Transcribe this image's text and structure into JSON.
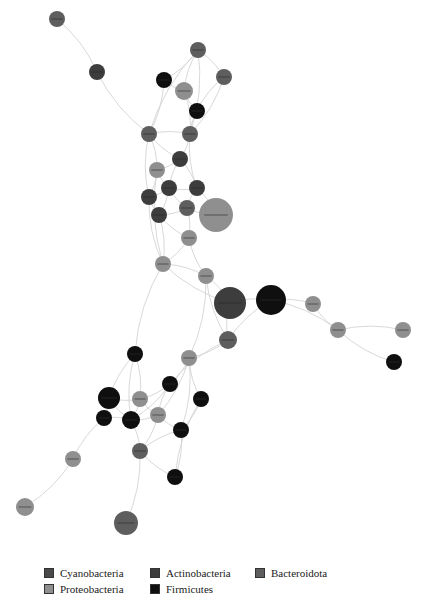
{
  "diagram": {
    "type": "co-occurrence network",
    "phylum_colors": {
      "Cyanobacteria": "#4a4a4a",
      "Actinobacteria": "#3d3d3d",
      "Bacteroidota": "#5e5e5e",
      "Proteobacteria": "#8f8f8f",
      "Firmicutes": "#0f0f0f"
    },
    "nodes": [
      {
        "id": "n1",
        "x": 57,
        "y": 19,
        "r": 8,
        "phylum": "Bacteroidota"
      },
      {
        "id": "n2",
        "x": 97,
        "y": 72,
        "r": 8,
        "phylum": "Actinobacteria"
      },
      {
        "id": "n3",
        "x": 198,
        "y": 50,
        "r": 8,
        "phylum": "Bacteroidota"
      },
      {
        "id": "n4",
        "x": 164,
        "y": 80,
        "r": 8,
        "phylum": "Firmicutes"
      },
      {
        "id": "n5",
        "x": 184,
        "y": 91,
        "r": 9,
        "phylum": "Proteobacteria"
      },
      {
        "id": "n6",
        "x": 224,
        "y": 77,
        "r": 8,
        "phylum": "Bacteroidota"
      },
      {
        "id": "n7",
        "x": 197,
        "y": 111,
        "r": 8,
        "phylum": "Firmicutes"
      },
      {
        "id": "n8",
        "x": 149,
        "y": 134,
        "r": 8,
        "phylum": "Bacteroidota"
      },
      {
        "id": "n9",
        "x": 190,
        "y": 134,
        "r": 8,
        "phylum": "Bacteroidota"
      },
      {
        "id": "n10",
        "x": 180,
        "y": 159,
        "r": 8,
        "phylum": "Actinobacteria"
      },
      {
        "id": "n11",
        "x": 157,
        "y": 170,
        "r": 8,
        "phylum": "Proteobacteria"
      },
      {
        "id": "n12",
        "x": 169,
        "y": 188,
        "r": 8,
        "phylum": "Actinobacteria"
      },
      {
        "id": "n13",
        "x": 197,
        "y": 188,
        "r": 8,
        "phylum": "Actinobacteria"
      },
      {
        "id": "n14",
        "x": 149,
        "y": 197,
        "r": 8,
        "phylum": "Actinobacteria"
      },
      {
        "id": "n15",
        "x": 187,
        "y": 208,
        "r": 8,
        "phylum": "Bacteroidota"
      },
      {
        "id": "n16",
        "x": 159,
        "y": 215,
        "r": 8,
        "phylum": "Actinobacteria"
      },
      {
        "id": "n17",
        "x": 216,
        "y": 215,
        "r": 17,
        "phylum": "Proteobacteria"
      },
      {
        "id": "n18",
        "x": 189,
        "y": 238,
        "r": 8,
        "phylum": "Proteobacteria"
      },
      {
        "id": "n19",
        "x": 163,
        "y": 264,
        "r": 8,
        "phylum": "Proteobacteria"
      },
      {
        "id": "n20",
        "x": 206,
        "y": 276,
        "r": 8,
        "phylum": "Proteobacteria"
      },
      {
        "id": "n21",
        "x": 230,
        "y": 303,
        "r": 16,
        "phylum": "Actinobacteria"
      },
      {
        "id": "n22",
        "x": 271,
        "y": 300,
        "r": 15,
        "phylum": "Firmicutes"
      },
      {
        "id": "n23",
        "x": 313,
        "y": 304,
        "r": 8,
        "phylum": "Proteobacteria"
      },
      {
        "id": "n24",
        "x": 338,
        "y": 330,
        "r": 8,
        "phylum": "Proteobacteria"
      },
      {
        "id": "n25",
        "x": 403,
        "y": 330,
        "r": 8,
        "phylum": "Proteobacteria"
      },
      {
        "id": "n26",
        "x": 394,
        "y": 362,
        "r": 8,
        "phylum": "Firmicutes"
      },
      {
        "id": "n27",
        "x": 228,
        "y": 340,
        "r": 9,
        "phylum": "Bacteroidota"
      },
      {
        "id": "n28",
        "x": 189,
        "y": 358,
        "r": 8,
        "phylum": "Proteobacteria"
      },
      {
        "id": "n29",
        "x": 135,
        "y": 354,
        "r": 8,
        "phylum": "Firmicutes"
      },
      {
        "id": "n30",
        "x": 170,
        "y": 384,
        "r": 8,
        "phylum": "Firmicutes"
      },
      {
        "id": "n31",
        "x": 109,
        "y": 398,
        "r": 11,
        "phylum": "Firmicutes"
      },
      {
        "id": "n32",
        "x": 140,
        "y": 399,
        "r": 8,
        "phylum": "Proteobacteria"
      },
      {
        "id": "n33",
        "x": 201,
        "y": 399,
        "r": 8,
        "phylum": "Firmicutes"
      },
      {
        "id": "n34",
        "x": 104,
        "y": 418,
        "r": 8,
        "phylum": "Firmicutes"
      },
      {
        "id": "n35",
        "x": 131,
        "y": 420,
        "r": 9,
        "phylum": "Firmicutes"
      },
      {
        "id": "n36",
        "x": 158,
        "y": 415,
        "r": 8,
        "phylum": "Proteobacteria"
      },
      {
        "id": "n37",
        "x": 181,
        "y": 430,
        "r": 8,
        "phylum": "Firmicutes"
      },
      {
        "id": "n38",
        "x": 140,
        "y": 451,
        "r": 8,
        "phylum": "Bacteroidota"
      },
      {
        "id": "n39",
        "x": 73,
        "y": 459,
        "r": 8,
        "phylum": "Proteobacteria"
      },
      {
        "id": "n40",
        "x": 175,
        "y": 477,
        "r": 8,
        "phylum": "Firmicutes"
      },
      {
        "id": "n41",
        "x": 25,
        "y": 507,
        "r": 9,
        "phylum": "Proteobacteria"
      },
      {
        "id": "n42",
        "x": 126,
        "y": 523,
        "r": 12,
        "phylum": "Bacteroidota"
      }
    ],
    "edges": [
      [
        "n1",
        "n2"
      ],
      [
        "n2",
        "n8"
      ],
      [
        "n3",
        "n4"
      ],
      [
        "n3",
        "n5"
      ],
      [
        "n3",
        "n6"
      ],
      [
        "n3",
        "n8"
      ],
      [
        "n3",
        "n9"
      ],
      [
        "n4",
        "n5"
      ],
      [
        "n4",
        "n8"
      ],
      [
        "n5",
        "n7"
      ],
      [
        "n5",
        "n9"
      ],
      [
        "n6",
        "n7"
      ],
      [
        "n6",
        "n9"
      ],
      [
        "n7",
        "n9"
      ],
      [
        "n8",
        "n9"
      ],
      [
        "n8",
        "n10"
      ],
      [
        "n8",
        "n11"
      ],
      [
        "n8",
        "n14"
      ],
      [
        "n9",
        "n10"
      ],
      [
        "n9",
        "n13"
      ],
      [
        "n10",
        "n11"
      ],
      [
        "n10",
        "n12"
      ],
      [
        "n10",
        "n13"
      ],
      [
        "n11",
        "n12"
      ],
      [
        "n11",
        "n14"
      ],
      [
        "n12",
        "n13"
      ],
      [
        "n12",
        "n14"
      ],
      [
        "n12",
        "n15"
      ],
      [
        "n12",
        "n16"
      ],
      [
        "n13",
        "n15"
      ],
      [
        "n13",
        "n17"
      ],
      [
        "n14",
        "n16"
      ],
      [
        "n15",
        "n16"
      ],
      [
        "n15",
        "n17"
      ],
      [
        "n15",
        "n18"
      ],
      [
        "n16",
        "n18"
      ],
      [
        "n16",
        "n19"
      ],
      [
        "n14",
        "n19"
      ],
      [
        "n18",
        "n19"
      ],
      [
        "n18",
        "n20"
      ],
      [
        "n19",
        "n20"
      ],
      [
        "n19",
        "n21"
      ],
      [
        "n20",
        "n21"
      ],
      [
        "n20",
        "n27"
      ],
      [
        "n21",
        "n22"
      ],
      [
        "n21",
        "n27"
      ],
      [
        "n22",
        "n23"
      ],
      [
        "n22",
        "n27"
      ],
      [
        "n22",
        "n24"
      ],
      [
        "n23",
        "n24"
      ],
      [
        "n24",
        "n25"
      ],
      [
        "n24",
        "n26"
      ],
      [
        "n27",
        "n28"
      ],
      [
        "n27",
        "n30"
      ],
      [
        "n28",
        "n30"
      ],
      [
        "n28",
        "n33"
      ],
      [
        "n28",
        "n36"
      ],
      [
        "n29",
        "n31"
      ],
      [
        "n29",
        "n32"
      ],
      [
        "n29",
        "n35"
      ],
      [
        "n30",
        "n32"
      ],
      [
        "n30",
        "n36"
      ],
      [
        "n30",
        "n35"
      ],
      [
        "n31",
        "n32"
      ],
      [
        "n31",
        "n34"
      ],
      [
        "n31",
        "n35"
      ],
      [
        "n32",
        "n35"
      ],
      [
        "n32",
        "n36"
      ],
      [
        "n33",
        "n37"
      ],
      [
        "n33",
        "n40"
      ],
      [
        "n34",
        "n35"
      ],
      [
        "n35",
        "n36"
      ],
      [
        "n35",
        "n38"
      ],
      [
        "n36",
        "n37"
      ],
      [
        "n36",
        "n38"
      ],
      [
        "n37",
        "n38"
      ],
      [
        "n37",
        "n40"
      ],
      [
        "n38",
        "n40"
      ],
      [
        "n38",
        "n42"
      ],
      [
        "n34",
        "n39"
      ],
      [
        "n39",
        "n41"
      ],
      [
        "n19",
        "n29"
      ],
      [
        "n20",
        "n28"
      ],
      [
        "n11",
        "n19"
      ],
      [
        "n28",
        "n37"
      ]
    ]
  },
  "legend": {
    "items": [
      {
        "label": "Cyanobacteria",
        "color": "#4a4a4a"
      },
      {
        "label": "Actinobacteria",
        "color": "#3d3d3d"
      },
      {
        "label": "Bacteroidota",
        "color": "#5e5e5e"
      },
      {
        "label": "Proteobacteria",
        "color": "#8f8f8f"
      },
      {
        "label": "Firmicutes",
        "color": "#0f0f0f"
      }
    ]
  }
}
